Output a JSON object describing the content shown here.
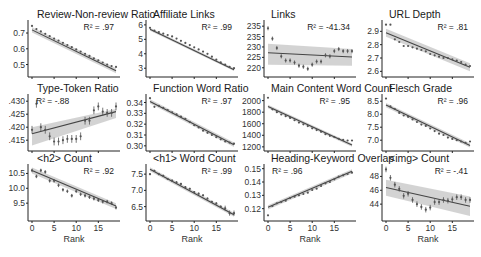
{
  "figure": {
    "layout": {
      "rows": 3,
      "cols": 4
    },
    "x_label": "Rank",
    "x_ticks": [
      0,
      5,
      10,
      15
    ],
    "colors": {
      "points": "#555555",
      "fit_line": "#444444",
      "ci_band": "#c8c8c8",
      "axis": "#222222"
    }
  },
  "chart_data": [
    {
      "type": "scatter",
      "title": "Review-Non-review Ratio",
      "r2_label": "R² = .97",
      "xlabel": "",
      "ylabel": "",
      "yticks": [
        "0.5",
        "0.6",
        "0.7"
      ],
      "ytick_values": [
        0.5,
        0.6,
        0.7
      ],
      "ylim": [
        0.44,
        0.77
      ],
      "x": [
        0,
        1,
        2,
        3,
        4,
        5,
        6,
        7,
        8,
        9,
        10,
        11,
        12,
        13,
        14,
        15,
        16,
        17,
        18,
        19
      ],
      "values": [
        0.745,
        0.725,
        0.71,
        0.695,
        0.68,
        0.665,
        0.652,
        0.638,
        0.624,
        0.61,
        0.596,
        0.582,
        0.568,
        0.555,
        0.54,
        0.527,
        0.513,
        0.5,
        0.49,
        0.485
      ],
      "fit": [
        0.72,
        0.46
      ],
      "band": 0.008
    },
    {
      "type": "scatter",
      "title": "Affiliate Links",
      "r2_label": "R² = .99",
      "yticks": [
        "3",
        "4",
        "5",
        "6"
      ],
      "ytick_values": [
        3,
        4,
        5,
        6
      ],
      "ylim": [
        2.6,
        6.2
      ],
      "x": [
        0,
        1,
        2,
        3,
        4,
        5,
        6,
        7,
        8,
        9,
        10,
        11,
        12,
        13,
        14,
        15,
        16,
        17,
        18,
        19
      ],
      "values": [
        5.8,
        5.6,
        5.5,
        5.4,
        5.3,
        5.2,
        5.05,
        4.9,
        4.75,
        4.6,
        4.45,
        4.3,
        4.15,
        4.0,
        3.8,
        3.6,
        3.4,
        3.25,
        3.1,
        3.0
      ],
      "fit": [
        5.7,
        2.9
      ],
      "band": 0.05
    },
    {
      "type": "scatter",
      "title": "Links",
      "r2_label": "R² = -41.34",
      "yticks": [
        "220",
        "225",
        "230",
        "235",
        "235"
      ],
      "ytick_values": [
        220,
        225,
        230,
        235,
        240
      ],
      "ylim": [
        217,
        242
      ],
      "x": [
        0,
        1,
        2,
        3,
        4,
        5,
        6,
        7,
        8,
        9,
        10,
        11,
        12,
        13,
        14,
        15,
        16,
        17,
        18,
        19
      ],
      "values": [
        239,
        234,
        229.5,
        225.5,
        223.5,
        223.5,
        222.5,
        221,
        220.5,
        219.5,
        221.5,
        223,
        223,
        226,
        225.5,
        228,
        229,
        228,
        228,
        228
      ],
      "errors": [
        1,
        1,
        1,
        1,
        1,
        1,
        1,
        1,
        1,
        1,
        1,
        1,
        1,
        1,
        1,
        1,
        1,
        1,
        1,
        1
      ],
      "fit": [
        227.2,
        225.2
      ],
      "band_start": [
        231.5,
        221.5
      ],
      "band_end": [
        229,
        221
      ]
    },
    {
      "type": "scatter",
      "title": "URL Depth",
      "r2_label": "R² = .81",
      "yticks": [
        "2.6",
        "2.7",
        "2.8",
        "2.9"
      ],
      "ytick_values": [
        2.6,
        2.7,
        2.8,
        2.9
      ],
      "ylim": [
        2.58,
        2.97
      ],
      "x": [
        0,
        1,
        2,
        3,
        4,
        5,
        6,
        7,
        8,
        9,
        10,
        11,
        12,
        13,
        14,
        15,
        16,
        17,
        18,
        19
      ],
      "values": [
        2.95,
        2.95,
        2.84,
        2.82,
        2.79,
        2.79,
        2.78,
        2.77,
        2.76,
        2.75,
        2.73,
        2.72,
        2.71,
        2.7,
        2.7,
        2.69,
        2.68,
        2.67,
        2.65,
        2.64
      ],
      "fit": [
        2.89,
        2.63
      ],
      "band": 0.015
    },
    {
      "type": "scatter",
      "title": "Type-Token Ratio",
      "r2_label": "R² = -.88",
      "yticks": [
        ".415",
        ".420",
        ".425",
        ".430"
      ],
      "ytick_values": [
        0.415,
        0.42,
        0.425,
        0.43
      ],
      "ylim": [
        0.412,
        0.432
      ],
      "x": [
        0,
        1,
        2,
        3,
        4,
        5,
        6,
        7,
        8,
        9,
        10,
        11,
        12,
        13,
        14,
        15,
        16,
        17,
        18,
        19
      ],
      "values": [
        0.419,
        0.429,
        0.42,
        0.419,
        0.4165,
        0.4145,
        0.4145,
        0.415,
        0.4155,
        0.4155,
        0.4155,
        0.4165,
        0.4225,
        0.4225,
        0.4265,
        0.428,
        0.426,
        0.4255,
        0.4255,
        0.428
      ],
      "errors": [
        0.0015,
        0.0015,
        0.0015,
        0.0015,
        0.0015,
        0.0015,
        0.0015,
        0.0015,
        0.0015,
        0.0015,
        0.0015,
        0.0015,
        0.0015,
        0.0015,
        0.0015,
        0.0015,
        0.0015,
        0.0015,
        0.0015,
        0.0015
      ],
      "fit": [
        0.4175,
        0.426
      ],
      "band_start": [
        0.42,
        0.413
      ],
      "band_end": [
        0.427,
        0.4235
      ]
    },
    {
      "type": "scatter",
      "title": "Function Word Ratio",
      "r2_label": "R² = .97",
      "yticks": [
        "0.30",
        "0.31",
        "0.32",
        "0.33",
        "0.34"
      ],
      "ytick_values": [
        0.3,
        0.31,
        0.32,
        0.33,
        0.34
      ],
      "ylim": [
        0.298,
        0.346
      ],
      "x": [
        0,
        1,
        2,
        3,
        4,
        5,
        6,
        7,
        8,
        9,
        10,
        11,
        12,
        13,
        14,
        15,
        16,
        17,
        18,
        19
      ],
      "values": [
        0.344,
        0.336,
        0.337,
        0.335,
        0.333,
        0.331,
        0.329,
        0.327,
        0.325,
        0.322,
        0.319,
        0.317,
        0.314,
        0.312,
        0.31,
        0.308,
        0.306,
        0.304,
        0.303,
        0.302
      ],
      "fit": [
        0.341,
        0.301
      ],
      "band": 0.001
    },
    {
      "type": "scatter",
      "title": "Main Content Word Count",
      "r2_label": "R² = .95",
      "yticks": [
        "1200",
        "1400",
        "1600",
        "1800",
        "2000"
      ],
      "ytick_values": [
        1200,
        1400,
        1600,
        1800,
        2000
      ],
      "ylim": [
        1180,
        2080
      ],
      "x": [
        0,
        1,
        2,
        3,
        4,
        5,
        6,
        7,
        8,
        9,
        10,
        11,
        12,
        13,
        14,
        15,
        16,
        17,
        18,
        19
      ],
      "values": [
        2050,
        1850,
        1800,
        1760,
        1730,
        1700,
        1660,
        1620,
        1590,
        1560,
        1520,
        1490,
        1460,
        1420,
        1390,
        1370,
        1340,
        1320,
        1310,
        1310
      ],
      "fit": [
        1900,
        1230
      ],
      "band": 15
    },
    {
      "type": "scatter",
      "title": "Flesch Grade",
      "r2_label": "R² = .96",
      "yticks": [
        "7.0",
        "7.5",
        "8.0",
        "8.5"
      ],
      "ytick_values": [
        7.0,
        7.5,
        8.0,
        8.5
      ],
      "ylim": [
        6.7,
        8.7
      ],
      "x": [
        0,
        1,
        2,
        3,
        4,
        5,
        6,
        7,
        8,
        9,
        10,
        11,
        12,
        13,
        14,
        15,
        16,
        17,
        18,
        19
      ],
      "values": [
        8.6,
        8.3,
        8.2,
        8.05,
        7.95,
        7.9,
        7.8,
        7.7,
        7.6,
        7.55,
        7.45,
        7.35,
        7.25,
        7.2,
        7.1,
        7.05,
        7.0,
        6.95,
        6.9,
        6.95
      ],
      "fit": [
        8.35,
        6.8
      ],
      "band": 0.04
    },
    {
      "type": "scatter",
      "title": "<h2> Count",
      "r2_label": "R² = .92",
      "yticks": [
        "9.5",
        "10.0",
        "10.5"
      ],
      "ytick_values": [
        9.5,
        10.0,
        10.5
      ],
      "ylim": [
        9.0,
        10.75
      ],
      "x": [
        0,
        1,
        2,
        3,
        4,
        5,
        6,
        7,
        8,
        9,
        10,
        11,
        12,
        13,
        14,
        15,
        16,
        17,
        18,
        19
      ],
      "values": [
        10.6,
        10.4,
        10.6,
        10.55,
        10.25,
        10.25,
        10.1,
        9.95,
        9.9,
        9.75,
        9.9,
        9.8,
        9.75,
        9.7,
        9.65,
        9.6,
        9.55,
        9.55,
        9.5,
        9.35
      ],
      "errors": [
        0.06,
        0.06,
        0.06,
        0.06,
        0.06,
        0.06,
        0.06,
        0.06,
        0.06,
        0.06,
        0.06,
        0.06,
        0.06,
        0.06,
        0.06,
        0.06,
        0.06,
        0.06,
        0.06,
        0.06
      ],
      "fit": [
        10.6,
        9.4
      ],
      "band": 0.05
    },
    {
      "type": "scatter",
      "title": "<h1> Word Count",
      "r2_label": "R² = .99",
      "yticks": [
        "6.5",
        "7.0",
        "7.5"
      ],
      "ytick_values": [
        6.5,
        7.0,
        7.5
      ],
      "ylim": [
        6.15,
        7.75
      ],
      "x": [
        0,
        1,
        2,
        3,
        4,
        5,
        6,
        7,
        8,
        9,
        10,
        11,
        12,
        13,
        14,
        15,
        16,
        17,
        18,
        19
      ],
      "values": [
        7.5,
        7.6,
        7.5,
        7.45,
        7.35,
        7.3,
        7.25,
        7.2,
        7.1,
        7.05,
        6.95,
        6.9,
        6.85,
        6.75,
        6.65,
        6.6,
        6.5,
        6.45,
        6.3,
        6.3
      ],
      "errors": [
        0.03,
        0.03,
        0.03,
        0.03,
        0.03,
        0.03,
        0.03,
        0.03,
        0.03,
        0.03,
        0.03,
        0.03,
        0.03,
        0.03,
        0.03,
        0.03,
        0.03,
        0.08,
        0.08,
        0.08
      ],
      "fit": [
        7.65,
        6.25
      ],
      "band": 0.03
    },
    {
      "type": "scatter",
      "title": "Heading-Keyword Overlap",
      "r2_label": "R² = .96",
      "yticks": [
        "0.12",
        "0.13",
        "0.14",
        "0.15"
      ],
      "ytick_values": [
        0.12,
        0.13,
        0.14,
        0.15
      ],
      "ylim": [
        0.113,
        0.152
      ],
      "x": [
        0,
        1,
        2,
        3,
        4,
        5,
        6,
        7,
        8,
        9,
        10,
        11,
        12,
        13,
        14,
        15,
        16,
        17,
        18,
        19
      ],
      "values": [
        0.115,
        0.122,
        0.124,
        0.125,
        0.126,
        0.128,
        0.129,
        0.13,
        0.131,
        0.132,
        0.134,
        0.135,
        0.137,
        0.139,
        0.14,
        0.142,
        0.144,
        0.145,
        0.146,
        0.147
      ],
      "fit": [
        0.121,
        0.148
      ],
      "band": 0.0008
    },
    {
      "type": "scatter",
      "title": "<img> Count",
      "r2_label": "R² = -.41",
      "yticks": [
        "44",
        "46",
        "48"
      ],
      "ytick_values": [
        44,
        46,
        48
      ],
      "ylim": [
        42,
        49.5
      ],
      "x": [
        0,
        1,
        2,
        3,
        4,
        5,
        6,
        7,
        8,
        9,
        10,
        11,
        12,
        13,
        14,
        15,
        16,
        17,
        18,
        19
      ],
      "values": [
        49,
        47.8,
        46.8,
        46.2,
        45.2,
        45.5,
        44.6,
        44.0,
        43.6,
        43.2,
        43.5,
        44.3,
        44.3,
        44.6,
        44.5,
        44.7,
        45.0,
        45.0,
        44.6,
        44.6
      ],
      "errors": [
        0.4,
        0.4,
        0.4,
        0.4,
        0.4,
        0.4,
        0.4,
        0.4,
        0.4,
        0.4,
        0.4,
        0.4,
        0.4,
        0.4,
        0.4,
        0.4,
        0.4,
        0.4,
        0.4,
        0.4
      ],
      "fit": [
        46.4,
        43.7
      ],
      "band_start": [
        47.5,
        45.2
      ],
      "band_end": [
        45.1,
        42.3
      ]
    }
  ]
}
